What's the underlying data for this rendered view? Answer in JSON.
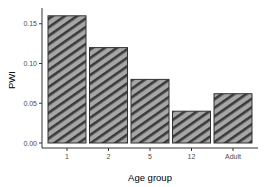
{
  "chart_data": {
    "type": "bar",
    "title": "",
    "xlabel": "Age group",
    "ylabel": "PWI",
    "categories": [
      "1",
      "2",
      "5",
      "12",
      "Adult"
    ],
    "values": [
      0.16,
      0.12,
      0.08,
      0.04,
      0.062
    ],
    "ylim": [
      0,
      0.165
    ],
    "yticks": [
      "0.00",
      "0.05",
      "0.10",
      "0.15"
    ],
    "ytick_values": [
      0,
      0.05,
      0.1,
      0.15
    ],
    "grid": false,
    "legend": null,
    "fill": "diagonal hatch",
    "colors": {
      "bar_fill": "#a6a6a6",
      "hatch": "#3a3a3a",
      "bar_border": "#333333",
      "axis": "#333333"
    }
  }
}
